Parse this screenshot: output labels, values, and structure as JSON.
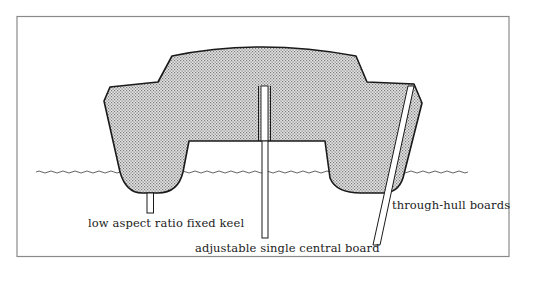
{
  "diagram": {
    "colors": {
      "frame": "#8a8a8a",
      "outline": "#1a1a1a",
      "hull_fill": "#cfcfcf",
      "water": "#555555",
      "background": "#ffffff"
    },
    "labels": {
      "keel": "low aspect ratio fixed keel",
      "central_board": "adjustable single central board",
      "through_hull": "through-hull boards"
    },
    "components": [
      {
        "id": "hull",
        "label": "catamaran hull cross-section"
      },
      {
        "id": "waterline",
        "label": "water surface"
      },
      {
        "id": "keel",
        "label": "low aspect ratio fixed keel"
      },
      {
        "id": "central_board",
        "label": "adjustable single central board"
      },
      {
        "id": "through_hull_board",
        "label": "through-hull boards"
      }
    ]
  }
}
